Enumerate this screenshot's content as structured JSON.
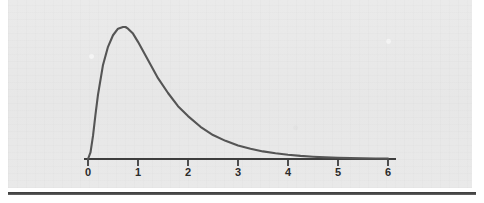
{
  "figure": {
    "title": "",
    "background_color": "#e8e8e8",
    "curve_color": "#555555",
    "axis_color": "#3d3d3d",
    "label_color": "#2b2b2b",
    "rule_color": "#4a4a4a"
  },
  "axis": {
    "tick_labels": [
      "0",
      "1",
      "2",
      "3",
      "4",
      "5",
      "6"
    ],
    "tick_positions_px": [
      88,
      138,
      188,
      238,
      288,
      338,
      388
    ],
    "baseline_y_px": 159,
    "start_x_px": 84,
    "end_x_px": 396
  },
  "chart_data": {
    "type": "line",
    "title": "",
    "xlabel": "",
    "ylabel": "",
    "grid": false,
    "legend": "none",
    "xlim": [
      -0.1,
      6.2
    ],
    "ylim": [
      0,
      0.85
    ],
    "categories": null,
    "annotations": [],
    "series": [
      {
        "name": "Right-skewed probability density",
        "x": [
          0.0,
          0.05,
          0.1,
          0.15,
          0.2,
          0.3,
          0.4,
          0.5,
          0.6,
          0.7,
          0.75,
          0.8,
          0.9,
          1.0,
          1.2,
          1.4,
          1.6,
          1.8,
          2.0,
          2.25,
          2.5,
          2.75,
          3.0,
          3.25,
          3.5,
          3.75,
          4.0,
          4.25,
          4.5,
          4.75,
          5.0,
          5.25,
          5.5,
          5.75,
          6.0
        ],
        "y": [
          0.0,
          0.04,
          0.14,
          0.27,
          0.39,
          0.57,
          0.68,
          0.75,
          0.79,
          0.8,
          0.8,
          0.79,
          0.76,
          0.71,
          0.6,
          0.49,
          0.4,
          0.32,
          0.26,
          0.195,
          0.145,
          0.11,
          0.082,
          0.062,
          0.046,
          0.035,
          0.026,
          0.019,
          0.014,
          0.01,
          0.0075,
          0.0055,
          0.004,
          0.003,
          0.002
        ]
      }
    ]
  }
}
